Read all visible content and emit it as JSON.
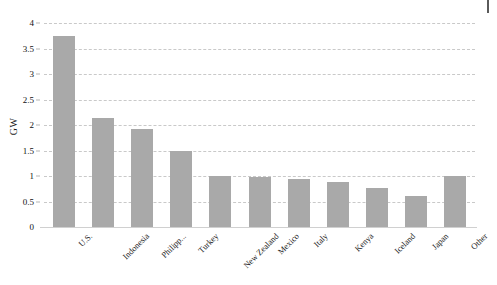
{
  "chart_data": {
    "type": "bar",
    "title": "",
    "xlabel": "",
    "ylabel": "GW",
    "ylim": [
      0,
      4
    ],
    "ytick_step": 0.5,
    "grid": true,
    "grid_style": "dashed",
    "legend": "none",
    "bar_color": "#a9a9a9",
    "categories": [
      "U.S.",
      "Indonesia",
      "Philipp...",
      "Turkey",
      "New Zealand",
      "Mexico",
      "Italy",
      "Kenya",
      "Iceland",
      "Japan",
      "Other"
    ],
    "values": [
      3.74,
      2.14,
      1.93,
      1.5,
      1.0,
      0.98,
      0.95,
      0.88,
      0.76,
      0.6,
      1.0
    ],
    "ytick_labels": [
      "0",
      "0.5",
      "1",
      "1.5",
      "2",
      "2.5",
      "3",
      "3.5",
      "4"
    ],
    "ytick_values": [
      0,
      0.5,
      1,
      1.5,
      2,
      2.5,
      3,
      3.5,
      4
    ]
  },
  "marks": {
    "corner_tick": ""
  }
}
